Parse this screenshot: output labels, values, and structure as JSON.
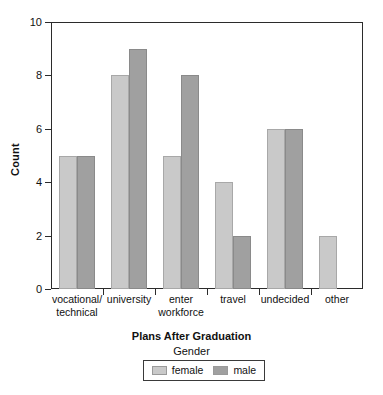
{
  "chart_data": {
    "type": "bar",
    "title": "",
    "xlabel": "Plans After Graduation",
    "ylabel": "Count",
    "categories": [
      "vocational/\ntechnical",
      "university",
      "enter\nworkforce",
      "travel",
      "undecided",
      "other"
    ],
    "series": [
      {
        "name": "female",
        "color": "#c9c9c9",
        "values": [
          5,
          8,
          5,
          4,
          6,
          2
        ]
      },
      {
        "name": "male",
        "color": "#a0a0a0",
        "values": [
          5,
          9,
          8,
          2,
          6,
          0
        ]
      }
    ],
    "ylim": [
      0,
      10
    ],
    "yticks": [
      0,
      2,
      4,
      6,
      8,
      10
    ],
    "ytick_labels": [
      "0",
      "2",
      "4",
      "6",
      "8",
      "10"
    ],
    "grid": false,
    "legend": {
      "title": "Gender",
      "position": "bottom",
      "entries": [
        {
          "label": "female",
          "color": "#c9c9c9"
        },
        {
          "label": "male",
          "color": "#a0a0a0"
        }
      ]
    }
  }
}
